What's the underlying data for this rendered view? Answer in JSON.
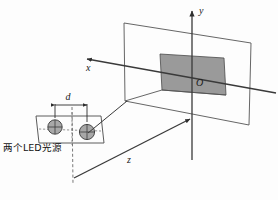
{
  "figure": {
    "background_color": "#fdfdfd",
    "line_color": "#3a3a3a",
    "shaded_fill": "#9a9a9a",
    "led_fill": "#a8a8a8"
  },
  "axes": {
    "y_label": "y",
    "x_label": "x",
    "z_label": "z",
    "origin_label": "O"
  },
  "dimensions": {
    "separation_label": "d"
  },
  "annotations": {
    "led_source_label": "两个LED光源"
  },
  "icons": {
    "y_arrow": "arrow-up-icon",
    "x_arrow": "arrow-upleft-icon",
    "z_arrow": "arrow-upright-icon",
    "dimension_arrows": "double-arrow-icon"
  }
}
